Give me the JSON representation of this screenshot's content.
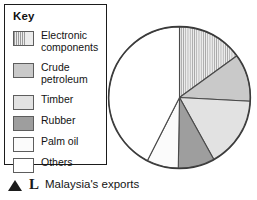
{
  "figure": {
    "caption": {
      "marker": "triangle-up-icon",
      "letter": "L",
      "text": "Malaysia's exports"
    }
  },
  "legend": {
    "title": "Key",
    "items": [
      {
        "label": "Electronic\ncomponents",
        "swatch": "vertical-hatch",
        "color": "#e3e3e3"
      },
      {
        "label": "Crude\npetroleum",
        "swatch": "solid",
        "color": "#c9c9c9"
      },
      {
        "label": "Timber",
        "swatch": "solid",
        "color": "#e2e2e2"
      },
      {
        "label": "Rubber",
        "swatch": "solid",
        "color": "#9e9e9e"
      },
      {
        "label": "Palm oil",
        "swatch": "solid",
        "color": "#fbfbfb"
      },
      {
        "label": "Others",
        "swatch": "solid",
        "color": "#ffffff"
      }
    ]
  },
  "chart_data": {
    "type": "pie",
    "title": "Malaysia's exports",
    "xlabel": "",
    "ylabel": "",
    "grid": false,
    "legend_position": "left",
    "start_angle_deg": 0,
    "direction": "clockwise",
    "labels": [
      "Electronic components",
      "Crude petroleum",
      "Timber",
      "Rubber",
      "Palm oil",
      "Others"
    ],
    "angles_deg": [
      54,
      39,
      58,
      30,
      26,
      153
    ],
    "values_percent": [
      15,
      10.8,
      16.1,
      8.3,
      7.2,
      42.5
    ],
    "colors": [
      "#e3e3e3",
      "#c9c9c9",
      "#e2e2e2",
      "#9e9e9e",
      "#fbfbfb",
      "#ffffff"
    ],
    "slices": [
      {
        "label": "Electronic components",
        "start_deg": 0,
        "end_deg": 54,
        "angle_deg": 54,
        "percent": 15.0,
        "fill": "vertical-hatch"
      },
      {
        "label": "Crude petroleum",
        "start_deg": 54,
        "end_deg": 93,
        "angle_deg": 39,
        "percent": 10.8,
        "fill": "#c9c9c9"
      },
      {
        "label": "Timber",
        "start_deg": 93,
        "end_deg": 151,
        "angle_deg": 58,
        "percent": 16.1,
        "fill": "#e2e2e2"
      },
      {
        "label": "Rubber",
        "start_deg": 151,
        "end_deg": 181,
        "angle_deg": 30,
        "percent": 8.3,
        "fill": "#9e9e9e"
      },
      {
        "label": "Palm oil",
        "start_deg": 181,
        "end_deg": 207,
        "angle_deg": 26,
        "percent": 7.2,
        "fill": "#fbfbfb"
      },
      {
        "label": "Others",
        "start_deg": 207,
        "end_deg": 360,
        "angle_deg": 153,
        "percent": 42.5,
        "fill": "#ffffff"
      }
    ]
  }
}
